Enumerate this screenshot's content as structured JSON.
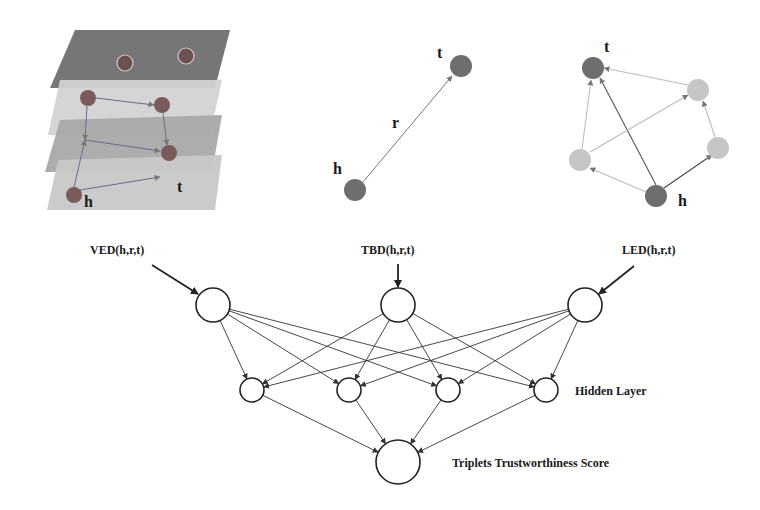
{
  "panels": {
    "visual": {
      "layers": [
        {
          "points": "75,30 230,30 215,88 50,88",
          "color": "#6f6f6f"
        },
        {
          "points": "60,80 222,80 210,135 48,135",
          "color": "#d3d3d3"
        },
        {
          "points": "60,120 222,115 212,172 45,172",
          "color": "#a9a9a9"
        },
        {
          "points": "58,160 222,155 215,210 47,210",
          "color": "#c8c8c8"
        }
      ],
      "nodes": [
        {
          "x": 125,
          "y": 63,
          "r": 8,
          "color": "#6a5252",
          "ring": true
        },
        {
          "x": 186,
          "y": 56,
          "r": 8,
          "color": "#6a5252",
          "ring": true
        },
        {
          "x": 88,
          "y": 98,
          "r": 8,
          "color": "#7a5a5a"
        },
        {
          "x": 162,
          "y": 105,
          "r": 8,
          "color": "#7a5a5a"
        },
        {
          "x": 169,
          "y": 153,
          "r": 8,
          "color": "#7a5a5a"
        },
        {
          "x": 74,
          "y": 195,
          "r": 8,
          "color": "#7a5a5a"
        }
      ],
      "edges": [
        {
          "x1": 96,
          "y1": 98,
          "x2": 154,
          "y2": 105
        },
        {
          "x1": 87,
          "y1": 106,
          "x2": 85,
          "y2": 140
        },
        {
          "x1": 85,
          "y1": 140,
          "x2": 160,
          "y2": 151
        },
        {
          "x1": 163,
          "y1": 113,
          "x2": 167,
          "y2": 145
        },
        {
          "x1": 80,
          "y1": 190,
          "x2": 160,
          "y2": 177
        },
        {
          "x1": 74,
          "y1": 187,
          "x2": 85,
          "y2": 140
        }
      ],
      "labels": [
        {
          "text": "h",
          "x": 84,
          "y": 207
        },
        {
          "text": "t",
          "x": 177,
          "y": 192
        }
      ]
    },
    "translation": {
      "nodes": [
        {
          "x": 461,
          "y": 66,
          "r": 11,
          "color": "#6e6e6e"
        },
        {
          "x": 355,
          "y": 190,
          "r": 11,
          "color": "#6e6e6e"
        }
      ],
      "edge": {
        "x1": 363,
        "y1": 182,
        "x2": 452,
        "y2": 76
      },
      "labels": [
        {
          "text": "t",
          "x": 437,
          "y": 58
        },
        {
          "text": "h",
          "x": 333,
          "y": 174
        },
        {
          "text": "r",
          "x": 392,
          "y": 128
        }
      ]
    },
    "local": {
      "nodes": [
        {
          "x": 593,
          "y": 68,
          "r": 11,
          "color": "#6e6e6e"
        },
        {
          "x": 698,
          "y": 90,
          "r": 11,
          "color": "#c6c6c6"
        },
        {
          "x": 718,
          "y": 148,
          "r": 11,
          "color": "#c6c6c6"
        },
        {
          "x": 580,
          "y": 160,
          "r": 11,
          "color": "#c6c6c6"
        },
        {
          "x": 656,
          "y": 196,
          "r": 11,
          "color": "#6e6e6e"
        }
      ],
      "edges": [
        {
          "x1": 656,
          "y1": 185,
          "x2": 600,
          "y2": 78,
          "color": "#555"
        },
        {
          "x1": 664,
          "y1": 188,
          "x2": 712,
          "y2": 155,
          "color": "#444"
        },
        {
          "x1": 646,
          "y1": 192,
          "x2": 590,
          "y2": 168,
          "color": "#bbb"
        },
        {
          "x1": 590,
          "y1": 152,
          "x2": 688,
          "y2": 95,
          "color": "#bbb"
        },
        {
          "x1": 582,
          "y1": 149,
          "x2": 591,
          "y2": 80,
          "color": "#bbb"
        },
        {
          "x1": 715,
          "y1": 137,
          "x2": 703,
          "y2": 101,
          "color": "#bbb"
        },
        {
          "x1": 688,
          "y1": 85,
          "x2": 604,
          "y2": 68,
          "color": "#bbb"
        }
      ],
      "labels": [
        {
          "text": "t",
          "x": 604,
          "y": 52
        },
        {
          "text": "h",
          "x": 678,
          "y": 206
        }
      ]
    }
  },
  "network": {
    "inputs": [
      {
        "label": "VED(h,r,t)",
        "x": 213,
        "y": 305,
        "r": 17,
        "label_x": 90,
        "label_y": 254,
        "arrow": {
          "x1": 152,
          "y1": 265,
          "x2": 198,
          "y2": 294
        }
      },
      {
        "label": "TBD(h,r,t)",
        "x": 398,
        "y": 305,
        "r": 17,
        "label_x": 361,
        "label_y": 254,
        "arrow": {
          "x1": 398,
          "y1": 264,
          "x2": 398,
          "y2": 287
        }
      },
      {
        "label": "LED(h,r,t)",
        "x": 585,
        "y": 305,
        "r": 17,
        "label_x": 622,
        "label_y": 254,
        "arrow": {
          "x1": 634,
          "y1": 266,
          "x2": 599,
          "y2": 294
        }
      }
    ],
    "hidden": [
      {
        "x": 252,
        "y": 390,
        "r": 12
      },
      {
        "x": 349,
        "y": 390,
        "r": 12
      },
      {
        "x": 448,
        "y": 390,
        "r": 12
      },
      {
        "x": 546,
        "y": 390,
        "r": 12
      }
    ],
    "output": {
      "x": 398,
      "y": 462,
      "r": 22
    },
    "hidden_label": {
      "text": "Hidden Layer",
      "x": 575,
      "y": 395
    },
    "output_label": {
      "text": "Triplets Trustworthiness Score",
      "x": 452,
      "y": 467
    }
  }
}
